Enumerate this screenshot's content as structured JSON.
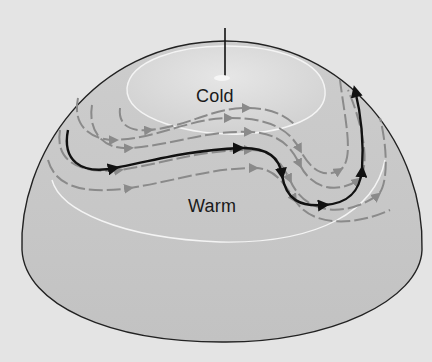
{
  "diagram": {
    "type": "hemisphere-jet-stream",
    "labels": {
      "cold": "Cold",
      "warm": "Warm"
    },
    "elements": {
      "axis": "polar axis line",
      "main_flow": "black jet stream path with arrows",
      "secondary_flows": "gray flow lines with arrows",
      "isolines": "white temperature boundary curves"
    },
    "colors": {
      "background": "#e4e4e4",
      "hemisphere_top": "#d2d2d2",
      "hemisphere_base": "#c4c4c4",
      "cold_cap": "#dadada",
      "main_flow": "#111111",
      "secondary_flow": "#8a8a8a",
      "isoline": "#f4f4f4",
      "outline": "#222222"
    }
  }
}
